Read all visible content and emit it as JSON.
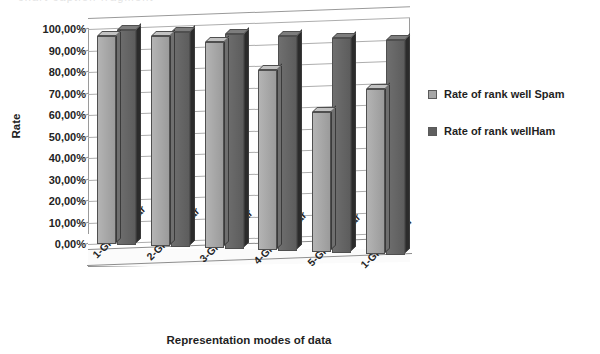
{
  "chart_data": {
    "type": "bar",
    "title": "",
    "xlabel": "Representation modes of data",
    "ylabel": "Rate",
    "categories": [
      "1-Grams Char",
      "2-Grams Char",
      "3-Grams Char",
      "4-Grams Char",
      "5-Grams Char",
      "1-Gram Word"
    ],
    "series": [
      {
        "name": "Rate of rank well Spam",
        "color": "#a6a6a6",
        "values": [
          97,
          98,
          96,
          84,
          65,
          77
        ]
      },
      {
        "name": "Rate of rank wellHam",
        "color": "#5f5f5f",
        "values": [
          100,
          100,
          100,
          100,
          100,
          100
        ]
      }
    ],
    "ylim": [
      0,
      100
    ],
    "ytick_values": [
      0,
      10,
      20,
      30,
      40,
      50,
      60,
      70,
      80,
      90,
      100
    ],
    "ytick_labels": [
      "0,00%",
      "10,00%",
      "20,00%",
      "30,00%",
      "40,00%",
      "50,00%",
      "60,00%",
      "70,00%",
      "80,00%",
      "90,00%",
      "100,00%"
    ],
    "grid": true,
    "legend_position": "right",
    "three_d": true
  },
  "axes": {
    "y_title": "Rate",
    "x_title": "Representation modes of data"
  },
  "legend": {
    "items": [
      {
        "label": "Rate of rank well Spam"
      },
      {
        "label": "Rate of rank wellHam"
      }
    ]
  },
  "top_crop": {
    "text": "chart caption fragment"
  }
}
